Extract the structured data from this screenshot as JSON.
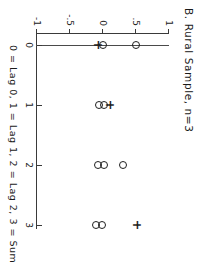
{
  "chart_data": {
    "type": "scatter",
    "title": "B. Rural Sample, n=3",
    "xlabel": "0 = Lag 0, 1 = Lag 1, 2 = Lag 2, 3 = Sum",
    "ylabel": "",
    "xlim": [
      0,
      3
    ],
    "ylim": [
      -1,
      1
    ],
    "grid": false,
    "legend": "none",
    "x_ticks": [
      {
        "value": 0,
        "label": "0"
      },
      {
        "value": 1,
        "label": "1"
      },
      {
        "value": 2,
        "label": "2"
      },
      {
        "value": 3,
        "label": "3"
      }
    ],
    "y_ticks": [
      {
        "value": 1,
        "label": "1"
      },
      {
        "value": 0.5,
        "label": ".5"
      },
      {
        "value": 0,
        "label": "0"
      },
      {
        "value": -0.5,
        "label": "-.5"
      },
      {
        "value": -1,
        "label": "-1"
      }
    ],
    "reference_line": {
      "axis": "y",
      "value": 0
    },
    "series": [
      {
        "name": "circle-markers",
        "marker": "circle",
        "points": [
          {
            "x": 0,
            "y": 0.5
          },
          {
            "x": 0,
            "y": 0.0
          },
          {
            "x": 1,
            "y": 0.02
          },
          {
            "x": 1,
            "y": -0.06
          },
          {
            "x": 2,
            "y": 0.3
          },
          {
            "x": 2,
            "y": 0.01
          },
          {
            "x": 2,
            "y": -0.08
          },
          {
            "x": 3,
            "y": -0.01
          },
          {
            "x": 3,
            "y": -0.1
          }
        ]
      },
      {
        "name": "plus-markers",
        "marker": "plus",
        "points": [
          {
            "x": 0,
            "y": -0.08
          },
          {
            "x": 1,
            "y": 0.1
          },
          {
            "x": 3,
            "y": 0.52
          }
        ]
      }
    ]
  }
}
